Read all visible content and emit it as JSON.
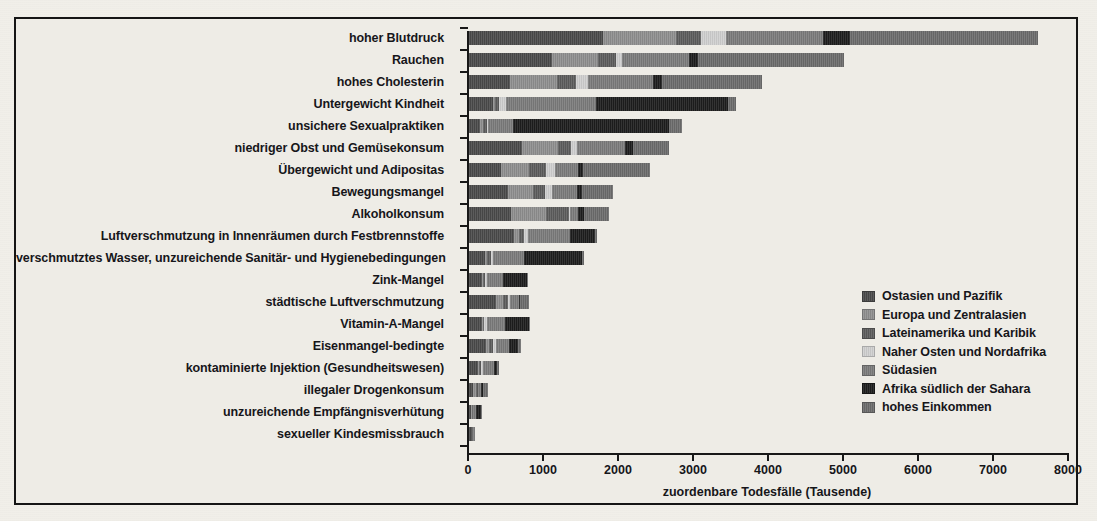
{
  "figure": {
    "background_color": "#eeece6",
    "frame_color": "#151515"
  },
  "axis": {
    "x_label": "zuordenbare Todesfälle (Tausende)",
    "x_ticks": [
      0,
      1000,
      2000,
      3000,
      4000,
      5000,
      6000,
      7000,
      8000
    ],
    "x_tick_labels": [
      "0",
      "1000",
      "2000",
      "3000",
      "4000",
      "5000",
      "6000",
      "7000",
      "8000"
    ],
    "x_min": 0,
    "x_max": 8000
  },
  "legend": {
    "position": "right-lower",
    "items": [
      {
        "label": "Ostasien und Pazifik",
        "color": "#4a4a4a"
      },
      {
        "label": "Europa und Zentralasien",
        "color": "#8e8e8e"
      },
      {
        "label": "Lateinamerika und Karibik",
        "color": "#5c5c5c"
      },
      {
        "label": "Naher Osten und Nordafrika",
        "color": "#cfcfcf"
      },
      {
        "label": "Südasien",
        "color": "#7b7b7b"
      },
      {
        "label": "Afrika südlich der Sahara",
        "color": "#1d1d1d"
      },
      {
        "label": "hohes Einkommen",
        "color": "#6b6b6b"
      }
    ]
  },
  "chart_data": {
    "type": "bar",
    "orientation": "horizontal",
    "stacked": true,
    "title": "",
    "subtitle": "",
    "xlabel": "zuordenbare Todesfälle (Tausende)",
    "ylabel": "",
    "xlim": [
      0,
      8000
    ],
    "grid": false,
    "legend_position": "right-lower",
    "categories": [
      "hoher Blutdruck",
      "Rauchen",
      "hohes Cholesterin",
      "Untergewicht Kindheit",
      "unsichere Sexualpraktiken",
      "niedriger Obst und Gemüsekonsum",
      "Übergewicht und Adipositas",
      "Bewegungsmangel",
      "Alkoholkonsum",
      "Luftverschmutzung in Innenräumen durch Festbrennstoffe",
      "verschmutztes Wasser, unzureichende Sanitär- und Hygienebedingungen",
      "Zink-Mangel",
      "städtische Luftverschmutzung",
      "Vitamin-A-Mangel",
      "Eisenmangel-bedingte",
      "kontaminierte Injektion (Gesundheitswesen)",
      "illegaler Drogenkonsum",
      "unzureichende Empfängnisverhütung",
      "sexueller Kindesmissbrauch"
    ],
    "series": [
      {
        "name": "Ostasien und Pazifik",
        "color": "#4a4a4a",
        "values": [
          1790,
          1100,
          540,
          320,
          150,
          700,
          420,
          520,
          560,
          600,
          210,
          170,
          360,
          170,
          220,
          120,
          55,
          25,
          35
        ]
      },
      {
        "name": "Europa und Zentralasien",
        "color": "#8e8e8e",
        "values": [
          970,
          620,
          630,
          20,
          30,
          480,
          380,
          330,
          470,
          70,
          30,
          20,
          95,
          15,
          45,
          15,
          35,
          10,
          5
        ]
      },
      {
        "name": "Lateinamerika und Karibik",
        "color": "#5c5c5c",
        "values": [
          330,
          240,
          250,
          60,
          60,
          180,
          230,
          160,
          300,
          60,
          50,
          25,
          60,
          20,
          55,
          30,
          30,
          12,
          8
        ]
      },
      {
        "name": "Naher Osten und Nordafrika",
        "color": "#cfcfcf",
        "values": [
          330,
          75,
          170,
          90,
          10,
          80,
          120,
          90,
          15,
          50,
          35,
          25,
          30,
          30,
          35,
          20,
          5,
          8,
          4
        ]
      },
      {
        "name": "Südasien",
        "color": "#7b7b7b",
        "values": [
          1300,
          900,
          860,
          1200,
          340,
          640,
          300,
          340,
          110,
          560,
          410,
          210,
          115,
          250,
          180,
          145,
          35,
          40,
          10
        ]
      },
      {
        "name": "Afrika südlich der Sahara",
        "color": "#1d1d1d",
        "values": [
          360,
          120,
          120,
          1760,
          2080,
          100,
          65,
          60,
          75,
          340,
          770,
          320,
          25,
          320,
          120,
          45,
          20,
          70,
          8
        ]
      },
      {
        "name": "hohes Einkommen",
        "color": "#6b6b6b",
        "values": [
          2500,
          1950,
          1330,
          110,
          175,
          490,
          900,
          420,
          330,
          30,
          30,
          20,
          120,
          10,
          40,
          25,
          70,
          10,
          8
        ]
      }
    ],
    "totals": [
      7580,
      5005,
      3900,
      3560,
      2845,
      2670,
      2415,
      1920,
      1860,
      1710,
      1535,
      790,
      805,
      815,
      695,
      400,
      250,
      175,
      78
    ]
  },
  "caption": ""
}
